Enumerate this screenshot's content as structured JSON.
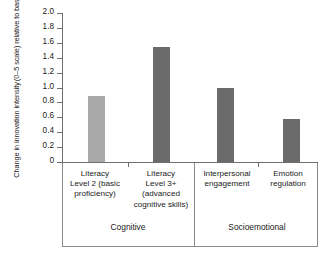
{
  "chart_data": {
    "type": "bar",
    "title": "",
    "xlabel": "",
    "ylabel_line1": "Change in innovation intensity",
    "ylabel_line2": "(0–5 scale) relative to baseline",
    "ylim": [
      0,
      2.0
    ],
    "ytick_labels": [
      "2.0",
      "1.8",
      "1.6",
      "1.4",
      "1.2",
      "1.0",
      "0.8",
      "0.6",
      "0.4",
      "0.2",
      "0"
    ],
    "ytick_values": [
      2.0,
      1.8,
      1.6,
      1.4,
      1.2,
      1.0,
      0.8,
      0.6,
      0.4,
      0.2,
      0
    ],
    "grid": false,
    "legend": "none",
    "categories": [
      "Literacy Level 2 (basic proficiency)",
      "Literacy Level 3+ (advanced cognitive skills)",
      "Interpersonal engagement",
      "Emotion regulation"
    ],
    "category_lines": [
      [
        "Literacy",
        "Level 2 (basic",
        "proficiency)"
      ],
      [
        "Literacy",
        "Level 3+",
        "(advanced",
        "cognitive skills)"
      ],
      [
        "Interpersonal",
        "engagement"
      ],
      [
        "Emotion",
        "regulation"
      ]
    ],
    "values": [
      0.88,
      1.55,
      1.0,
      0.58
    ],
    "bar_colors": [
      "#a9a9a9",
      "#6b6b6b",
      "#6b6b6b",
      "#6b6b6b"
    ],
    "groups": [
      {
        "label": "Cognitive",
        "categories": [
          0,
          1
        ]
      },
      {
        "label": "Socioemotional",
        "categories": [
          2,
          3
        ]
      }
    ],
    "group_labels": [
      "Cognitive",
      "Socioemotional"
    ]
  },
  "axis_color": "#6e6e6e",
  "box_color": "#8a8a8a"
}
